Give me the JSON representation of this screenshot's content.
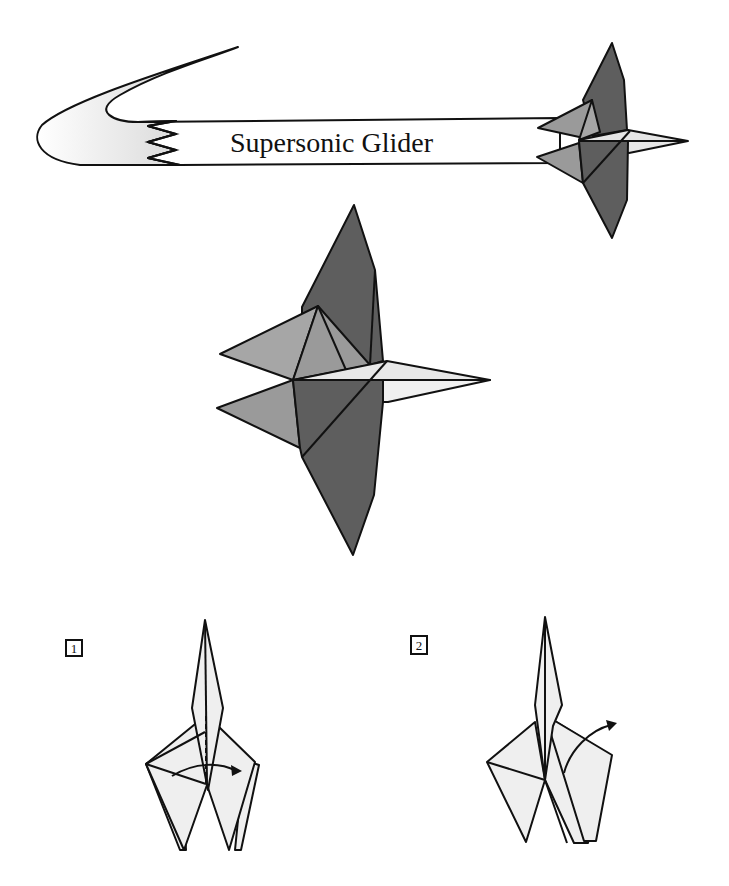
{
  "banner": {
    "title": "Supersonic Glider"
  },
  "steps": [
    {
      "number": "1"
    },
    {
      "number": "2"
    }
  ],
  "colors": {
    "dark_gray": "#5e5e5e",
    "mid_gray": "#9a9a9a",
    "light_gray": "#e6e6e6",
    "paper": "#efefef",
    "stroke": "#111111"
  }
}
